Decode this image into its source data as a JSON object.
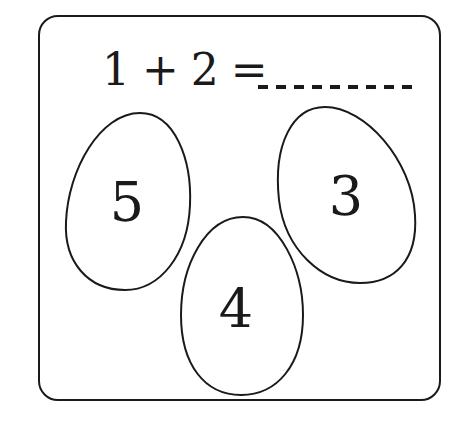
{
  "equation": {
    "text": "1 + 2 =",
    "blank_dash_count": 9
  },
  "eggs": [
    {
      "label": "5"
    },
    {
      "label": "4"
    },
    {
      "label": "3"
    }
  ],
  "colors": {
    "ink": "#1a1a1a",
    "background": "#ffffff"
  }
}
